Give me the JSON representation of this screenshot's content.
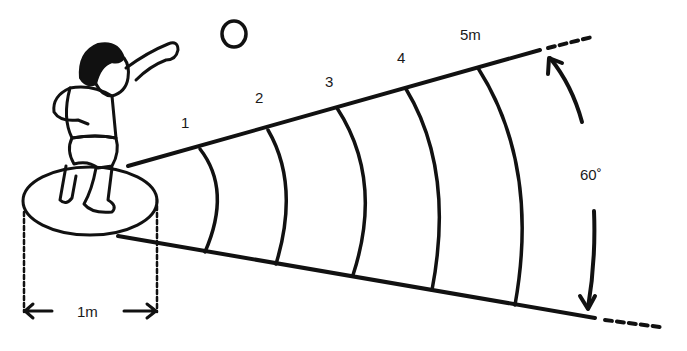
{
  "diagram": {
    "distance_labels": [
      "1",
      "2",
      "3",
      "4",
      "5m"
    ],
    "circle_diameter_label": "1m",
    "sector_angle_label": "60˚",
    "ball_label": "",
    "colors": {
      "ink": "#111111",
      "background": "#ffffff"
    }
  }
}
